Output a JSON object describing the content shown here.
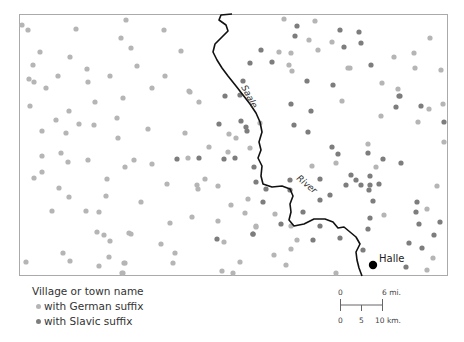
{
  "map": {
    "frame": {
      "x": 19,
      "y": 14,
      "w": 429,
      "h": 262
    },
    "river": {
      "name_parts": [
        "Saale",
        "River"
      ],
      "path": [
        [
          232,
          14
        ],
        [
          221,
          15
        ],
        [
          219,
          20
        ],
        [
          226,
          25
        ],
        [
          228,
          31
        ],
        [
          222,
          37
        ],
        [
          215,
          44
        ],
        [
          213,
          52
        ],
        [
          217,
          60
        ],
        [
          222,
          68
        ],
        [
          228,
          76
        ],
        [
          236,
          86
        ],
        [
          243,
          95
        ],
        [
          250,
          104
        ],
        [
          256,
          113
        ],
        [
          260,
          122
        ],
        [
          262,
          132
        ],
        [
          259,
          142
        ],
        [
          261,
          150
        ],
        [
          258,
          158
        ],
        [
          262,
          166
        ],
        [
          261,
          176
        ],
        [
          263,
          184
        ],
        [
          272,
          187
        ],
        [
          282,
          186
        ],
        [
          290,
          189
        ],
        [
          293,
          196
        ],
        [
          290,
          204
        ],
        [
          291,
          212
        ],
        [
          289,
          220
        ],
        [
          294,
          226
        ],
        [
          304,
          224
        ],
        [
          314,
          219
        ],
        [
          325,
          219
        ],
        [
          333,
          222
        ],
        [
          338,
          228
        ],
        [
          344,
          227
        ],
        [
          350,
          232
        ],
        [
          356,
          237
        ],
        [
          360,
          244
        ],
        [
          356,
          252
        ],
        [
          357,
          260
        ],
        [
          359,
          268
        ],
        [
          362,
          276
        ]
      ],
      "color": "#111111"
    },
    "city": {
      "name": "Halle",
      "x": 373,
      "y": 265
    },
    "german_color": "#b5b5b5",
    "slavic_color": "#7d7d7d",
    "german_villages": [
      [
        22,
        25
      ],
      [
        28,
        30
      ],
      [
        76,
        29
      ],
      [
        126,
        20
      ],
      [
        164,
        30
      ],
      [
        121,
        38
      ],
      [
        131,
        48
      ],
      [
        181,
        51
      ],
      [
        40,
        52
      ],
      [
        70,
        57
      ],
      [
        33,
        65
      ],
      [
        87,
        69
      ],
      [
        137,
        66
      ],
      [
        110,
        76
      ],
      [
        165,
        76
      ],
      [
        29,
        79
      ],
      [
        34,
        82
      ],
      [
        58,
        76
      ],
      [
        88,
        82
      ],
      [
        46,
        88
      ],
      [
        152,
        88
      ],
      [
        189,
        91
      ],
      [
        123,
        98
      ],
      [
        30,
        106
      ],
      [
        95,
        102
      ],
      [
        69,
        111
      ],
      [
        56,
        120
      ],
      [
        79,
        124
      ],
      [
        94,
        125
      ],
      [
        117,
        118
      ],
      [
        42,
        131
      ],
      [
        66,
        133
      ],
      [
        118,
        138
      ],
      [
        42,
        156
      ],
      [
        61,
        153
      ],
      [
        68,
        162
      ],
      [
        88,
        160
      ],
      [
        42,
        172
      ],
      [
        34,
        178
      ],
      [
        107,
        179
      ],
      [
        59,
        188
      ],
      [
        69,
        197
      ],
      [
        106,
        196
      ],
      [
        52,
        211
      ],
      [
        86,
        211
      ],
      [
        99,
        212
      ],
      [
        97,
        232
      ],
      [
        104,
        235
      ],
      [
        110,
        241
      ],
      [
        129,
        233
      ],
      [
        63,
        253
      ],
      [
        70,
        261
      ],
      [
        109,
        257
      ],
      [
        26,
        262
      ],
      [
        99,
        266
      ],
      [
        125,
        263
      ],
      [
        123,
        273
      ],
      [
        190,
        92
      ],
      [
        199,
        102
      ],
      [
        148,
        129
      ],
      [
        185,
        133
      ],
      [
        229,
        134
      ],
      [
        236,
        138
      ],
      [
        209,
        147
      ],
      [
        228,
        152
      ],
      [
        134,
        160
      ],
      [
        125,
        167
      ],
      [
        152,
        164
      ],
      [
        188,
        158
      ],
      [
        167,
        184
      ],
      [
        205,
        179
      ],
      [
        197,
        185
      ],
      [
        218,
        186
      ],
      [
        198,
        189
      ],
      [
        141,
        202
      ],
      [
        231,
        205
      ],
      [
        248,
        199
      ],
      [
        245,
        213
      ],
      [
        192,
        217
      ],
      [
        170,
        223
      ],
      [
        218,
        221
      ],
      [
        256,
        227
      ],
      [
        131,
        234
      ],
      [
        224,
        242
      ],
      [
        161,
        244
      ],
      [
        175,
        253
      ],
      [
        124,
        263
      ],
      [
        173,
        263
      ],
      [
        240,
        262
      ],
      [
        222,
        271
      ],
      [
        233,
        273
      ],
      [
        122,
        273
      ],
      [
        284,
        19
      ],
      [
        315,
        21
      ],
      [
        309,
        40
      ],
      [
        332,
        42
      ],
      [
        279,
        52
      ],
      [
        291,
        53
      ],
      [
        318,
        50
      ],
      [
        289,
        65
      ],
      [
        292,
        71
      ],
      [
        348,
        68
      ],
      [
        430,
        38
      ],
      [
        394,
        57
      ],
      [
        414,
        53
      ],
      [
        350,
        68
      ],
      [
        415,
        68
      ],
      [
        441,
        70
      ],
      [
        382,
        83
      ],
      [
        398,
        89
      ],
      [
        342,
        101
      ],
      [
        260,
        123
      ],
      [
        250,
        148
      ],
      [
        336,
        163
      ],
      [
        312,
        166
      ],
      [
        429,
        109
      ],
      [
        443,
        104
      ],
      [
        381,
        116
      ],
      [
        418,
        122
      ],
      [
        444,
        142
      ],
      [
        368,
        144
      ],
      [
        376,
        167
      ],
      [
        437,
        186
      ],
      [
        275,
        214
      ],
      [
        256,
        226
      ],
      [
        291,
        226
      ],
      [
        297,
        240
      ],
      [
        291,
        249
      ],
      [
        274,
        255
      ],
      [
        286,
        265
      ],
      [
        336,
        273
      ],
      [
        427,
        209
      ],
      [
        384,
        215
      ],
      [
        433,
        258
      ],
      [
        427,
        270
      ]
    ],
    "slavic_villages": [
      [
        225,
        96
      ],
      [
        240,
        95
      ],
      [
        219,
        124
      ],
      [
        241,
        121
      ],
      [
        246,
        127
      ],
      [
        177,
        159
      ],
      [
        199,
        158
      ],
      [
        224,
        159
      ],
      [
        235,
        158
      ],
      [
        256,
        182
      ],
      [
        217,
        239
      ],
      [
        253,
        234
      ],
      [
        297,
        26
      ],
      [
        340,
        30
      ],
      [
        295,
        36
      ],
      [
        344,
        47
      ],
      [
        261,
        50
      ],
      [
        250,
        63
      ],
      [
        272,
        62
      ],
      [
        243,
        81
      ],
      [
        307,
        81
      ],
      [
        333,
        85
      ],
      [
        359,
        32
      ],
      [
        361,
        43
      ],
      [
        371,
        65
      ],
      [
        400,
        96
      ],
      [
        291,
        104
      ],
      [
        311,
        111
      ],
      [
        247,
        131
      ],
      [
        294,
        125
      ],
      [
        308,
        132
      ],
      [
        332,
        147
      ],
      [
        338,
        154
      ],
      [
        254,
        167
      ],
      [
        290,
        180
      ],
      [
        320,
        179
      ],
      [
        399,
        96
      ],
      [
        396,
        107
      ],
      [
        421,
        106
      ],
      [
        444,
        122
      ],
      [
        368,
        153
      ],
      [
        383,
        159
      ],
      [
        401,
        163
      ],
      [
        351,
        175
      ],
      [
        370,
        176
      ],
      [
        356,
        180
      ],
      [
        346,
        185
      ],
      [
        361,
        185
      ],
      [
        370,
        185
      ],
      [
        379,
        184
      ],
      [
        266,
        189
      ],
      [
        290,
        190
      ],
      [
        263,
        202
      ],
      [
        320,
        200
      ],
      [
        330,
        195
      ],
      [
        303,
        212
      ],
      [
        281,
        224
      ],
      [
        253,
        234
      ],
      [
        320,
        226
      ],
      [
        313,
        240
      ],
      [
        340,
        238
      ],
      [
        369,
        190
      ],
      [
        373,
        201
      ],
      [
        417,
        202
      ],
      [
        416,
        212
      ],
      [
        370,
        218
      ],
      [
        419,
        224
      ],
      [
        440,
        222
      ],
      [
        368,
        229
      ],
      [
        434,
        235
      ],
      [
        409,
        243
      ],
      [
        363,
        250
      ],
      [
        422,
        248
      ],
      [
        406,
        267
      ]
    ]
  },
  "legend": {
    "title": "Village or town name",
    "german_label": "with German suffix",
    "slavic_label": "with Slavic suffix"
  },
  "scale": {
    "miles_zero": "0",
    "miles_label": "6 mi.",
    "km_zero": "0",
    "km_mid": "5",
    "km_label": "10 km."
  }
}
